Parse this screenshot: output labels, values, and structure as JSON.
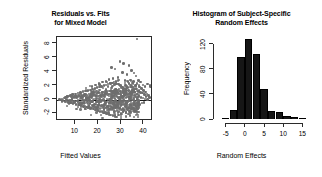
{
  "figure": {
    "background": "#ffffff",
    "point_color": "#6e6e6e",
    "bar_color": "#161616",
    "axis_color": "#2b2b2b"
  },
  "panels": [
    {
      "id": "residuals-vs-fits",
      "title_line1": "Residuals vs. Fits",
      "title_line2": "for Mixed Model",
      "xlabel": "Fitted Values",
      "ylabel": "Standardized Residuals",
      "xticks": [
        "10",
        "20",
        "30",
        "40"
      ],
      "yticks": [
        "-2",
        "0",
        "2",
        "4",
        "6",
        "8"
      ]
    },
    {
      "id": "random-effects-histogram",
      "title_line1": "Histogram of Subject-Specific",
      "title_line2": "Random Effects",
      "xlabel": "Random Effects",
      "ylabel": "Frequency",
      "xticks": [
        "-5",
        "0",
        "5",
        "10",
        "15"
      ],
      "yticks": [
        "0",
        "40",
        "80",
        "120"
      ]
    }
  ],
  "chart_data": [
    {
      "type": "scatter",
      "title": "Residuals vs. Fits for Mixed Model",
      "xlabel": "Fitted Values",
      "ylabel": "Standardized Residuals",
      "xlim": [
        2,
        44
      ],
      "ylim": [
        -3.1,
        9.0
      ],
      "xticks": [
        10,
        20,
        30,
        40
      ],
      "yticks": [
        -2,
        0,
        2,
        4,
        6,
        8
      ],
      "grid": false,
      "reference_line": {
        "type": "hline",
        "y": 0,
        "color": "#1a1a1a"
      },
      "marker_color": "#6e6e6e",
      "n_points": 520,
      "description": "Dense left-skewed cloud of standardized residuals fanning out with increasing fitted values; bulk between -2 and 2, with scattered high outliers up to about 8.7 near fitted value 37 and a low outlier near -3 at fitted value 43.",
      "points": [
        [
          3.2,
          0.0
        ],
        [
          3.6,
          -0.1
        ],
        [
          4.1,
          0.1
        ],
        [
          4.5,
          -0.2
        ],
        [
          5.0,
          0.2
        ],
        [
          5.4,
          -0.3
        ],
        [
          5.8,
          0.3
        ],
        [
          6.2,
          -0.1
        ],
        [
          6.6,
          0.4
        ],
        [
          7.0,
          -0.4
        ],
        [
          7.3,
          0.5
        ],
        [
          7.6,
          -0.2
        ],
        [
          7.9,
          0.6
        ],
        [
          8.2,
          -0.5
        ],
        [
          8.5,
          0.2
        ],
        [
          8.8,
          0.7
        ],
        [
          9.1,
          -0.6
        ],
        [
          9.4,
          0.3
        ],
        [
          9.7,
          -0.3
        ],
        [
          10.0,
          0.8
        ],
        [
          10.3,
          -0.7
        ],
        [
          10.6,
          0.4
        ],
        [
          10.9,
          -0.2
        ],
        [
          11.2,
          0.9
        ],
        [
          11.5,
          -0.8
        ],
        [
          11.8,
          0.5
        ],
        [
          12.0,
          -0.4
        ],
        [
          12.3,
          1.0
        ],
        [
          12.6,
          -0.9
        ],
        [
          12.9,
          0.6
        ],
        [
          13.1,
          -0.1
        ],
        [
          13.4,
          1.1
        ],
        [
          13.7,
          -1.0
        ],
        [
          14.0,
          0.7
        ],
        [
          14.2,
          -0.5
        ],
        [
          14.5,
          1.2
        ],
        [
          14.8,
          -1.1
        ],
        [
          15.0,
          0.3
        ],
        [
          15.3,
          -0.2
        ],
        [
          15.6,
          1.3
        ],
        [
          15.8,
          -1.2
        ],
        [
          16.1,
          0.8
        ],
        [
          16.4,
          -0.6
        ],
        [
          16.6,
          1.4
        ],
        [
          16.9,
          -1.3
        ],
        [
          17.1,
          0.4
        ],
        [
          17.4,
          -0.3
        ],
        [
          17.6,
          1.5
        ],
        [
          17.9,
          -1.4
        ],
        [
          18.1,
          0.9
        ],
        [
          18.4,
          -0.7
        ],
        [
          18.6,
          1.6
        ],
        [
          18.9,
          -1.5
        ],
        [
          19.1,
          0.5
        ],
        [
          19.4,
          -0.2
        ],
        [
          19.6,
          1.7
        ],
        [
          19.9,
          -1.6
        ],
        [
          20.1,
          1.0
        ],
        [
          20.3,
          -0.8
        ],
        [
          20.6,
          1.8
        ],
        [
          20.8,
          -1.7
        ],
        [
          21.1,
          0.6
        ],
        [
          21.3,
          -0.3
        ],
        [
          21.5,
          1.9
        ],
        [
          21.8,
          -1.8
        ],
        [
          22.0,
          1.1
        ],
        [
          22.3,
          -0.9
        ],
        [
          22.5,
          2.0
        ],
        [
          22.7,
          -1.9
        ],
        [
          23.0,
          0.7
        ],
        [
          23.2,
          -0.4
        ],
        [
          23.4,
          2.1
        ],
        [
          23.7,
          -2.0
        ],
        [
          23.9,
          1.2
        ],
        [
          24.1,
          -1.0
        ],
        [
          24.4,
          2.2
        ],
        [
          24.6,
          -2.1
        ],
        [
          24.8,
          0.8
        ],
        [
          25.0,
          -0.5
        ],
        [
          25.3,
          2.3
        ],
        [
          25.5,
          -2.2
        ],
        [
          25.7,
          1.3
        ],
        [
          25.9,
          -1.1
        ],
        [
          26.2,
          2.4
        ],
        [
          26.4,
          -2.3
        ],
        [
          26.6,
          0.9
        ],
        [
          26.8,
          -0.6
        ],
        [
          27.0,
          2.5
        ],
        [
          27.3,
          -2.4
        ],
        [
          27.5,
          1.4
        ],
        [
          27.7,
          -1.2
        ],
        [
          27.9,
          2.6
        ],
        [
          28.1,
          -2.5
        ],
        [
          28.4,
          1.0
        ],
        [
          28.6,
          -0.7
        ],
        [
          28.8,
          2.2
        ],
        [
          29.0,
          -2.2
        ],
        [
          29.2,
          1.5
        ],
        [
          29.5,
          -1.3
        ],
        [
          29.7,
          2.0
        ],
        [
          29.9,
          -2.0
        ],
        [
          30.1,
          1.1
        ],
        [
          30.3,
          -0.8
        ],
        [
          30.6,
          1.8
        ],
        [
          30.8,
          -1.8
        ],
        [
          31.0,
          1.6
        ],
        [
          31.2,
          -1.4
        ],
        [
          31.4,
          1.2
        ],
        [
          31.7,
          -1.0
        ],
        [
          31.9,
          2.1
        ],
        [
          32.1,
          -1.9
        ],
        [
          32.3,
          0.9
        ],
        [
          32.5,
          -0.6
        ],
        [
          32.8,
          1.7
        ],
        [
          33.0,
          -1.5
        ],
        [
          33.2,
          1.3
        ],
        [
          33.4,
          -1.1
        ],
        [
          33.6,
          2.3
        ],
        [
          33.9,
          -1.7
        ],
        [
          34.1,
          1.0
        ],
        [
          34.3,
          -0.9
        ],
        [
          34.5,
          1.9
        ],
        [
          34.7,
          -1.3
        ],
        [
          35.0,
          1.4
        ],
        [
          35.2,
          -0.8
        ],
        [
          35.4,
          2.6
        ],
        [
          35.6,
          -1.2
        ],
        [
          35.8,
          1.1
        ],
        [
          36.0,
          -0.6
        ],
        [
          36.3,
          2.0
        ],
        [
          36.5,
          -1.0
        ],
        [
          36.7,
          1.5
        ],
        [
          36.9,
          0.8
        ],
        [
          37.1,
          2.4
        ],
        [
          37.4,
          -0.9
        ],
        [
          37.6,
          1.2
        ],
        [
          37.8,
          0.5
        ],
        [
          38.0,
          1.8
        ],
        [
          38.2,
          -0.7
        ],
        [
          38.5,
          1.0
        ],
        [
          38.7,
          0.3
        ],
        [
          38.9,
          1.6
        ],
        [
          39.1,
          -0.5
        ],
        [
          39.3,
          0.9
        ],
        [
          39.6,
          0.2
        ],
        [
          39.8,
          1.3
        ],
        [
          40.0,
          -0.4
        ],
        [
          40.2,
          0.7
        ],
        [
          40.4,
          0.1
        ],
        [
          40.7,
          1.1
        ],
        [
          41.0,
          0.4
        ],
        [
          41.3,
          0.8
        ],
        [
          41.6,
          0.0
        ],
        [
          42.0,
          0.6
        ],
        [
          42.4,
          0.3
        ],
        [
          42.8,
          1.9
        ],
        [
          43.2,
          -3.0
        ],
        [
          36.9,
          8.7
        ],
        [
          29.6,
          5.5
        ],
        [
          31.2,
          5.2
        ],
        [
          25.9,
          4.6
        ],
        [
          27.4,
          4.4
        ],
        [
          33.4,
          4.9
        ],
        [
          34.6,
          4.2
        ],
        [
          30.7,
          3.9
        ],
        [
          32.6,
          3.6
        ],
        [
          35.6,
          3.8
        ],
        [
          36.6,
          3.4
        ],
        [
          28.6,
          3.2
        ],
        [
          26.5,
          3.0
        ],
        [
          24.8,
          2.9
        ],
        [
          34.1,
          2.8
        ],
        [
          37.6,
          2.7
        ],
        [
          38.6,
          2.5
        ],
        [
          35.1,
          2.4
        ],
        [
          33.0,
          2.6
        ],
        [
          31.8,
          2.7
        ],
        [
          39.6,
          2.1
        ],
        [
          40.6,
          1.9
        ],
        [
          41.6,
          2.2
        ],
        [
          42.6,
          2.0
        ],
        [
          29.1,
          2.8
        ],
        [
          23.4,
          2.6
        ],
        [
          21.9,
          2.5
        ],
        [
          20.4,
          2.3
        ],
        [
          18.9,
          2.1
        ],
        [
          17.4,
          1.9
        ]
      ]
    },
    {
      "type": "bar",
      "subtype": "histogram",
      "title": "Histogram of Subject-Specific Random Effects",
      "xlabel": "Random Effects",
      "ylabel": "Frequency",
      "xlim": [
        -7,
        17
      ],
      "ylim": [
        0,
        132
      ],
      "xticks": [
        -5,
        0,
        5,
        10,
        15
      ],
      "yticks": [
        0,
        40,
        80,
        120
      ],
      "grid": false,
      "bin_width": 2,
      "bin_edges": [
        -6,
        -4,
        -2,
        0,
        2,
        4,
        6,
        8,
        10,
        12,
        14,
        16
      ],
      "bin_centers": [
        -5,
        -3,
        -1,
        1,
        3,
        5,
        7,
        9,
        11,
        13,
        15
      ],
      "values": [
        2,
        15,
        98,
        128,
        104,
        47,
        13,
        12,
        5,
        3,
        1
      ],
      "bar_color": "#161616"
    }
  ]
}
